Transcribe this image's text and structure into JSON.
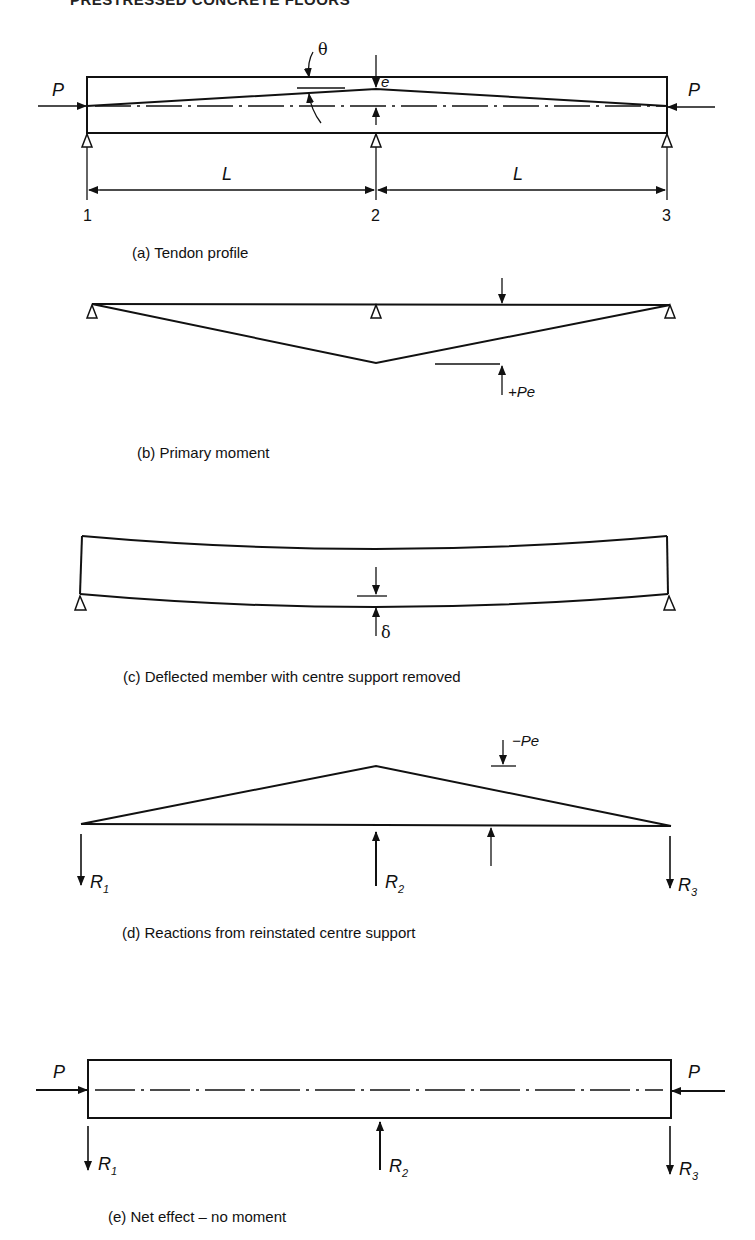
{
  "page": {
    "running_header": "PRESTRESSED CONCRETE FLOORS"
  },
  "figure": {
    "panels": [
      {
        "id": "a",
        "caption": "(a) Tendon profile",
        "labels": {
          "force_left": "P",
          "force_right": "P",
          "angle": "θ",
          "eccentricity": "e",
          "span_left": "L",
          "span_right": "L",
          "support_1": "1",
          "support_2": "2",
          "support_3": "3"
        }
      },
      {
        "id": "b",
        "caption": "(b) Primary moment",
        "labels": {
          "moment": "+Pe"
        }
      },
      {
        "id": "c",
        "caption": "(c) Deflected member with centre support removed",
        "labels": {
          "deflection": "δ"
        }
      },
      {
        "id": "d",
        "caption": "(d) Reactions from reinstated centre support",
        "labels": {
          "moment": "−Pe",
          "reaction_1": "R",
          "reaction_1_sub": "1",
          "reaction_2": "R",
          "reaction_2_sub": "2",
          "reaction_3": "R",
          "reaction_3_sub": "3"
        }
      },
      {
        "id": "e",
        "caption": "(e) Net effect – no moment",
        "labels": {
          "force_left": "P",
          "force_right": "P",
          "reaction_1": "R",
          "reaction_1_sub": "1",
          "reaction_2": "R",
          "reaction_2_sub": "2",
          "reaction_3": "R",
          "reaction_3_sub": "3"
        }
      }
    ]
  }
}
